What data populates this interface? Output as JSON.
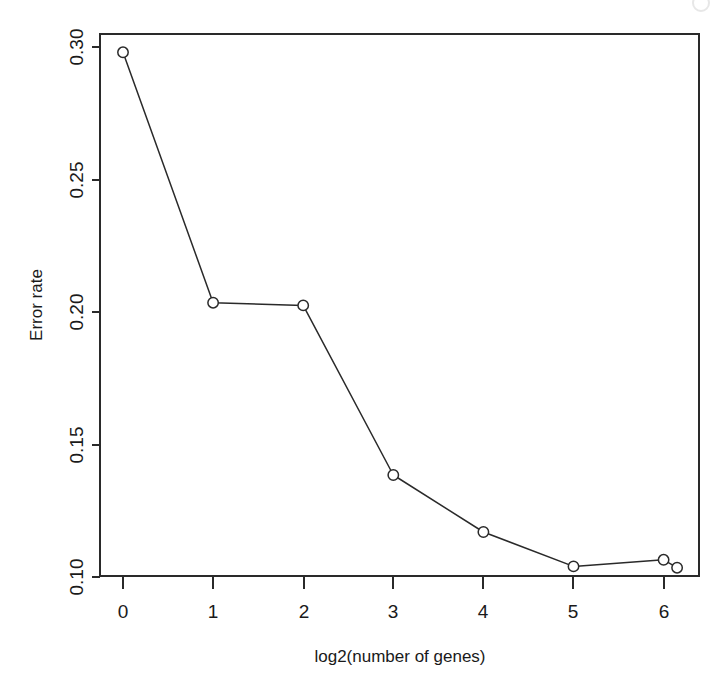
{
  "chart_data": {
    "type": "line",
    "title": "",
    "xlabel": "log2(number of genes)",
    "ylabel": "Error rate",
    "x": [
      0,
      1,
      2,
      3,
      4,
      5,
      6,
      6.15
    ],
    "values": [
      0.298,
      0.2035,
      0.2025,
      0.1385,
      0.117,
      0.104,
      0.1065,
      0.1035
    ],
    "series": [
      {
        "name": "Error rate",
        "x": [
          0,
          1,
          2,
          3,
          4,
          5,
          6,
          6.15
        ],
        "values": [
          0.298,
          0.2035,
          0.2025,
          0.1385,
          0.117,
          0.104,
          0.1065,
          0.1035
        ],
        "marker": "open-circle",
        "color": "#2a2a2a"
      }
    ],
    "xlim": [
      -0.28,
      6.4
    ],
    "ylim": [
      0.0855,
      0.3055
    ],
    "xticks": [
      0,
      1,
      2,
      3,
      4,
      5,
      6
    ],
    "xticklabels": [
      "0",
      "1",
      "2",
      "3",
      "4",
      "5",
      "6"
    ],
    "yticks": [
      0.1,
      0.15,
      0.2,
      0.25,
      0.3
    ],
    "yticklabels": [
      "0.10",
      "0.15",
      "0.20",
      "0.25",
      "0.30"
    ],
    "grid": false,
    "legend": false,
    "box": true,
    "ylabel_rotation": 90,
    "ytick_label_rotation": 90
  },
  "axes": {
    "x_title": "log2(number of genes)",
    "y_title": "Error rate"
  },
  "ticks": {
    "x": [
      {
        "label": "0",
        "value": 0
      },
      {
        "label": "1",
        "value": 1
      },
      {
        "label": "2",
        "value": 2
      },
      {
        "label": "3",
        "value": 3
      },
      {
        "label": "4",
        "value": 4
      },
      {
        "label": "5",
        "value": 5
      },
      {
        "label": "6",
        "value": 6
      }
    ],
    "y": [
      {
        "label": "0.10",
        "value": 0.1
      },
      {
        "label": "0.15",
        "value": 0.15
      },
      {
        "label": "0.20",
        "value": 0.2
      },
      {
        "label": "0.25",
        "value": 0.25
      },
      {
        "label": "0.30",
        "value": 0.3
      }
    ]
  },
  "colors": {
    "ink": "#2a2a2a",
    "background": "#ffffff"
  }
}
